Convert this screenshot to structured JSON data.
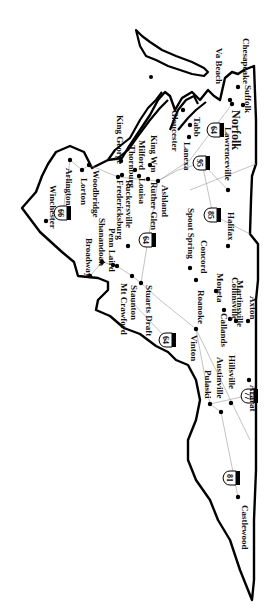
{
  "map": {
    "region": "Virginia",
    "orientation": "rotated 90 degrees clockwise",
    "colors": {
      "border": "#000000",
      "road": "#9a9a9a",
      "label": "#111111",
      "background": "#ffffff"
    },
    "cities": [
      {
        "id": "winchester",
        "label": "Winchester",
        "dot": [
          46,
          221
        ],
        "text": [
          50,
          185
        ]
      },
      {
        "id": "arlington",
        "label": "Arlington",
        "dot": [
          70,
          160
        ],
        "text": [
          66,
          168
        ]
      },
      {
        "id": "lorton",
        "label": "Lorton",
        "dot": [
          82,
          170
        ],
        "text": [
          81,
          178
        ]
      },
      {
        "id": "woodbridge",
        "label": "Woodbridge",
        "dot": [
          89,
          165
        ],
        "text": [
          93,
          170
        ]
      },
      {
        "id": "king-george",
        "label": "King George",
        "dot": [
          121,
          161
        ],
        "text": [
          117,
          115
        ]
      },
      {
        "id": "thornburg",
        "label": "Thornburg",
        "dot": [
          122,
          175
        ],
        "text": [
          129,
          145
        ]
      },
      {
        "id": "milford",
        "label": "Milford",
        "dot": [
          135,
          170
        ],
        "text": [
          139,
          140
        ]
      },
      {
        "id": "king-william",
        "label": "King Wm",
        "dot": [
          150,
          165
        ],
        "text": [
          151,
          135
        ]
      },
      {
        "id": "fredericksburg",
        "label": "Fredericksburg",
        "dot": [
          118,
          177
        ],
        "text": [
          117,
          180
        ]
      },
      {
        "id": "ruckersville",
        "label": "Ruckersville",
        "dot": [
          128,
          246
        ],
        "text": [
          126,
          180
        ]
      },
      {
        "id": "louisa",
        "label": "Louisa",
        "dot": [
          139,
          176
        ],
        "text": [
          139,
          178
        ]
      },
      {
        "id": "ruther-glen",
        "label": "Ruther Glen",
        "dot": [
          148,
          179
        ],
        "text": [
          151,
          182
        ]
      },
      {
        "id": "ashland",
        "label": "Ashland",
        "dot": [
          158,
          181
        ],
        "text": [
          162,
          185
        ]
      },
      {
        "id": "broadway",
        "label": "Broadway",
        "dot": [
          90,
          276
        ],
        "text": [
          86,
          238
        ]
      },
      {
        "id": "shanandoah",
        "label": "Shanandoah",
        "dot": [
          102,
          262
        ],
        "text": [
          99,
          218
        ]
      },
      {
        "id": "penn-laird",
        "label": "Penn Laird",
        "dot": [
          113,
          265
        ],
        "text": [
          109,
          228
        ]
      },
      {
        "id": "mt-crawford",
        "label": "Mt Crawford",
        "dot": [
          117,
          266
        ],
        "text": [
          121,
          283
        ]
      },
      {
        "id": "staunton",
        "label": "Staunton",
        "dot": [
          132,
          276
        ],
        "text": [
          131,
          285
        ]
      },
      {
        "id": "stuarts-draft",
        "label": "Stuarts Draft",
        "dot": [
          141,
          283
        ],
        "text": [
          146,
          285
        ]
      },
      {
        "id": "gloucester",
        "label": "Gloucester",
        "dot": [
          183,
          110
        ],
        "text": [
          172,
          110
        ]
      },
      {
        "id": "lanexa",
        "label": "Lanexa",
        "dot": [
          189,
          137
        ],
        "text": [
          184,
          142
        ]
      },
      {
        "id": "tabb",
        "label": "Tabb",
        "dot": [
          190,
          125
        ],
        "text": [
          194,
          117
        ]
      },
      {
        "id": "va-beach",
        "label": "Va Beach",
        "dot": [
          230,
          100
        ],
        "text": [
          216,
          48
        ]
      },
      {
        "id": "chesapeake",
        "label": "Chesapeake",
        "dot": [
          238,
          87
        ],
        "text": [
          243,
          38
        ]
      },
      {
        "id": "suffolk",
        "label": "Suffolk",
        "dot": [
          243,
          105
        ],
        "text": [
          245,
          85
        ]
      },
      {
        "id": "norfolk",
        "label": "Norfolk",
        "dot": [
          232,
          104
        ],
        "text": [
          232,
          110
        ]
      },
      {
        "id": "lawrenceville",
        "label": "Lawrenceville",
        "dot": [
          228,
          190
        ],
        "text": [
          225,
          127
        ]
      },
      {
        "id": "spout-spring",
        "label": "Spout Spring",
        "dot": [
          190,
          268
        ],
        "text": [
          188,
          208
        ]
      },
      {
        "id": "concord",
        "label": "Concord",
        "dot": [
          196,
          280
        ],
        "text": [
          201,
          240
        ]
      },
      {
        "id": "halifax",
        "label": "Halifax",
        "dot": [
          228,
          246
        ],
        "text": [
          228,
          212
        ]
      },
      {
        "id": "moneta",
        "label": "Moneta",
        "dot": [
          216,
          291
        ],
        "text": [
          217,
          273
        ]
      },
      {
        "id": "callands",
        "label": "Callands",
        "dot": [
          224,
          310
        ],
        "text": [
          221,
          313
        ]
      },
      {
        "id": "collinsville",
        "label": "Collinsville",
        "dot": [
          230,
          319
        ],
        "text": [
          232,
          277
        ]
      },
      {
        "id": "martinsville",
        "label": "Martinsville",
        "dot": [
          236,
          321
        ],
        "text": [
          237,
          280
        ]
      },
      {
        "id": "axton",
        "label": "Axton",
        "dot": [
          248,
          321
        ],
        "text": [
          250,
          296
        ]
      },
      {
        "id": "roanoke",
        "label": "Roanoke",
        "dot": [
          196,
          329
        ],
        "text": [
          198,
          290
        ]
      },
      {
        "id": "vinton",
        "label": "Vinton",
        "dot": [
          0,
          0
        ],
        "text": [
          191,
          335
        ]
      },
      {
        "id": "pulaski",
        "label": "Pulaski",
        "dot": [
          210,
          404
        ],
        "text": [
          205,
          370
        ]
      },
      {
        "id": "austinville",
        "label": "Austinville",
        "dot": [
          221,
          412
        ],
        "text": [
          217,
          357
        ]
      },
      {
        "id": "hillsville",
        "label": "Hillsville",
        "dot": [
          231,
          403
        ],
        "text": [
          229,
          355
        ]
      },
      {
        "id": "ararat",
        "label": "Ararat",
        "dot": [
          249,
          380
        ],
        "text": [
          250,
          385
        ]
      },
      {
        "id": "castlewood",
        "label": "Castlewood",
        "dot": [
          238,
          497
        ],
        "text": [
          242,
          505
        ]
      }
    ],
    "highways": [
      {
        "id": "i-66",
        "number": "66",
        "pos": [
          63,
          213
        ]
      },
      {
        "id": "i-64-north",
        "number": "64",
        "pos": [
          148,
          240
        ]
      },
      {
        "id": "i-64-west",
        "number": "64",
        "pos": [
          168,
          340
        ]
      },
      {
        "id": "i-64-east",
        "number": "64",
        "pos": [
          216,
          130
        ]
      },
      {
        "id": "i-95",
        "number": "95",
        "pos": [
          202,
          163
        ]
      },
      {
        "id": "i-85",
        "number": "85",
        "pos": [
          213,
          215
        ]
      },
      {
        "id": "i-77",
        "number": "77",
        "pos": [
          250,
          396
        ]
      },
      {
        "id": "i-81",
        "number": "81",
        "pos": [
          232,
          478
        ]
      }
    ]
  }
}
